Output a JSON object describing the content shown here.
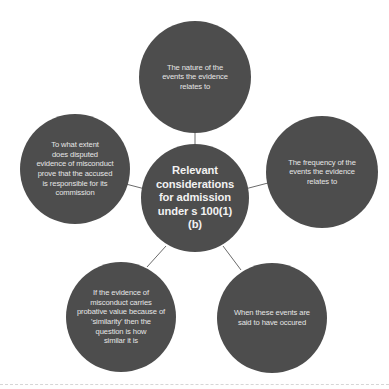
{
  "diagram": {
    "type": "mind-map",
    "center": {
      "label": "Relevant considerations for admission under s 100(1) (b)",
      "lines": [
        "Relevant",
        "considerations",
        "for admission",
        "under s 100(1)",
        "(b)"
      ]
    },
    "nodes": [
      {
        "position": "top",
        "label": "The nature of the events the evidence relates to",
        "lines": [
          "The nature of the",
          "events the evidence",
          "relates to"
        ]
      },
      {
        "position": "right",
        "label": "The frequency of the events the evidence relates to",
        "lines": [
          "The frequency of the",
          "events the evidence",
          "relates to"
        ]
      },
      {
        "position": "bottom-right",
        "label": "When these events are said to have occured",
        "lines": [
          "When these events are",
          "said to have occured"
        ]
      },
      {
        "position": "bottom-left",
        "label": "If the evidence of misconduct carries probative value because of 'similarity' then the question is how similar it is",
        "lines": [
          "If the evidence of",
          "misconduct carries",
          "probative value because of",
          "'similarity' then the",
          "question is how",
          "similar it is"
        ]
      },
      {
        "position": "left",
        "label": "To what extent does disputed evidence of misconduct prove that the accused is responsible for its commission",
        "lines": [
          "To what extent",
          "does disputed",
          "evidence of misconduct",
          "prove that the accused",
          "is responsible for its",
          "commission"
        ]
      }
    ],
    "colors": {
      "node_fill": "#4d4d4d",
      "node_text": "#e6e6e6",
      "connector": "#6b6b6b",
      "background": "#ffffff"
    }
  }
}
